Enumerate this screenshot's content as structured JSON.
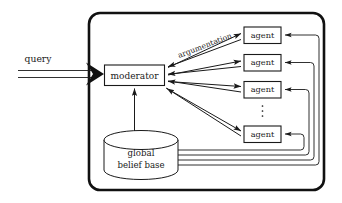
{
  "diagram": {
    "background_color": "#ffffff",
    "line_color": "#1a1a1a",
    "frame_color": "#111111",
    "system_frame": {
      "name": "system-boundary",
      "shape": "rounded-rectangle"
    },
    "input": {
      "label": "query",
      "arrow_style": "double-line-open-shaft-solid-head",
      "direction": "into-system"
    },
    "moderator": {
      "label": "moderator",
      "shape": "rectangle"
    },
    "belief_base": {
      "label_line_1": "global",
      "label_line_2": "belief base",
      "shape": "cylinder"
    },
    "argumentation": {
      "label": "argumentation",
      "rotation_deg": -21
    },
    "agents": [
      {
        "label": "agent",
        "index": 1
      },
      {
        "label": "agent",
        "index": 2
      },
      {
        "label": "agent",
        "index": 3
      },
      {
        "label": "agent",
        "index": 4
      }
    ],
    "ellipsis": {
      "symbol": "vertical-dots",
      "dot_count": 3,
      "meaning": "more agents"
    },
    "connections": [
      {
        "from": "query",
        "to": "moderator",
        "type": "thick-double-arrow"
      },
      {
        "from": "belief_base",
        "to": "moderator",
        "type": "arrow-up"
      },
      {
        "from": "moderator",
        "to": "agent-1",
        "type": "arrow"
      },
      {
        "from": "agent-1",
        "to": "moderator",
        "type": "arrow"
      },
      {
        "from": "moderator",
        "to": "agent-2",
        "type": "arrow"
      },
      {
        "from": "agent-2",
        "to": "moderator",
        "type": "arrow"
      },
      {
        "from": "moderator",
        "to": "agent-3",
        "type": "arrow"
      },
      {
        "from": "agent-3",
        "to": "moderator",
        "type": "arrow"
      },
      {
        "from": "moderator",
        "to": "agent-4",
        "type": "arrow"
      },
      {
        "from": "agent-4",
        "to": "moderator",
        "type": "arrow"
      },
      {
        "from": "belief_base",
        "to": "agent-1",
        "type": "routed-line-arrow"
      },
      {
        "from": "belief_base",
        "to": "agent-2",
        "type": "routed-line-arrow"
      },
      {
        "from": "belief_base",
        "to": "agent-3",
        "type": "routed-line-arrow"
      },
      {
        "from": "belief_base",
        "to": "agent-4",
        "type": "routed-line-arrow"
      }
    ]
  }
}
